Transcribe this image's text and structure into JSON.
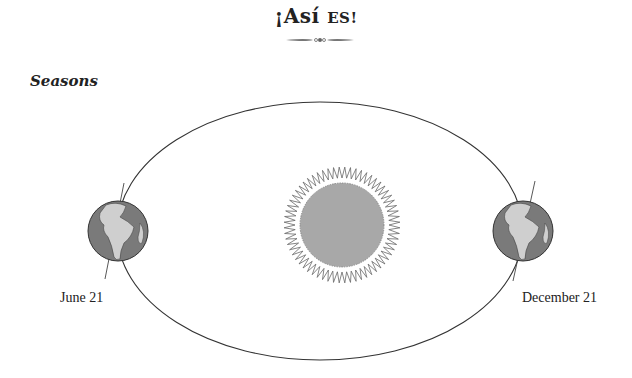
{
  "header": {
    "title_part1": "¡Así ",
    "title_part2": "ES!",
    "divider_icon": "ornamental-divider"
  },
  "section": {
    "title": "Seasons"
  },
  "diagram": {
    "type": "earth-orbit-seasons",
    "center_body": "sun-icon",
    "orbit_shape": "ellipse",
    "earth_positions": [
      {
        "label": "June 21",
        "side": "left",
        "icon": "earth-globe-icon"
      },
      {
        "label": "December 21",
        "side": "right",
        "icon": "earth-globe-icon"
      }
    ],
    "colors": {
      "orbit_line": "#333333",
      "sun_fill": "#a8a8a8",
      "sun_rays": "#666666",
      "ocean": "#7a7a7a",
      "land": "#cfcfcf"
    }
  }
}
